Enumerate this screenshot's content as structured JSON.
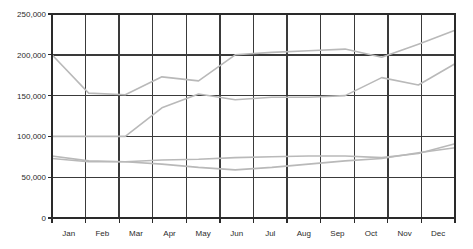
{
  "chart_data": {
    "type": "line",
    "title": "",
    "subtitle": "",
    "xlabel": "",
    "ylabel": "",
    "categories": [
      "Jan",
      "Feb",
      "Mar",
      "Apr",
      "May",
      "Jun",
      "Jul",
      "Aug",
      "Sep",
      "Oct",
      "Nov",
      "Dec"
    ],
    "ylim": [
      0,
      250000
    ],
    "yticks": [
      0,
      50000,
      100000,
      150000,
      200000,
      250000
    ],
    "ytick_labels": [
      "0",
      "50,000",
      "100,000",
      "150,000",
      "200,000",
      "250,000"
    ],
    "xtick_labels": [
      "Jan",
      "Feb",
      "Mar",
      "Apr",
      "May",
      "Jun",
      "Jul",
      "Aug",
      "Sep",
      "Oct",
      "Nov",
      "Dec"
    ],
    "grid": true,
    "grid_axis": "both",
    "legend": false,
    "legend_position": "none",
    "series": [
      {
        "name": "series-1",
        "color": "#b9b9b9",
        "values": [
          200000,
          153000,
          151000,
          173000,
          168000,
          200000,
          203000,
          205000,
          207000,
          197000,
          213000,
          230000
        ]
      },
      {
        "name": "series-2",
        "color": "#b9b9b9",
        "values": [
          100000,
          100000,
          100000,
          135000,
          152000,
          145000,
          148000,
          148000,
          150000,
          172000,
          163000,
          189000
        ]
      },
      {
        "name": "series-3",
        "color": "#b9b9b9",
        "values": [
          76000,
          70000,
          69000,
          71000,
          72000,
          74000,
          75000,
          76000,
          76000,
          74000,
          79000,
          91000
        ]
      },
      {
        "name": "series-4",
        "color": "#b9b9b9",
        "values": [
          73000,
          69000,
          69000,
          66000,
          62000,
          59000,
          62000,
          66000,
          70000,
          73000,
          80000,
          86000
        ]
      }
    ]
  },
  "axes": {
    "plot_left": 52,
    "plot_right": 455,
    "plot_top": 14,
    "plot_bottom": 218,
    "grid_color": "#3a3a3a",
    "axis_color": "#2a2a2a",
    "background": "#ffffff"
  }
}
